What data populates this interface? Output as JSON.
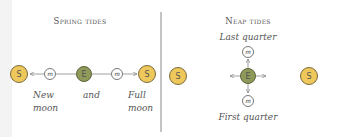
{
  "spring": {
    "title": "Spring tides",
    "sun_label": "S",
    "earth_label": "E",
    "moon_label": "m",
    "caption_left_1": "New",
    "caption_left_2": "moon",
    "caption_middle": "and",
    "caption_right_1": "Full",
    "caption_right_2": "moon"
  },
  "neap": {
    "title": "Neap tides",
    "top_label": "Last quarter",
    "bottom_label": "First quarter",
    "sun_left_label": "S",
    "sun_right_label": "S",
    "earth_label": "E",
    "moon_label": "m"
  },
  "colors": {
    "sun_fill": "#eec85a",
    "sun_stroke": "#7a6a3a",
    "earth_fill": "#8f9a5a",
    "earth_stroke": "#5a6238",
    "moon_fill": "#ffffff",
    "moon_stroke": "#555555",
    "line": "#888888",
    "divider": "#888888",
    "text": "#555555"
  }
}
